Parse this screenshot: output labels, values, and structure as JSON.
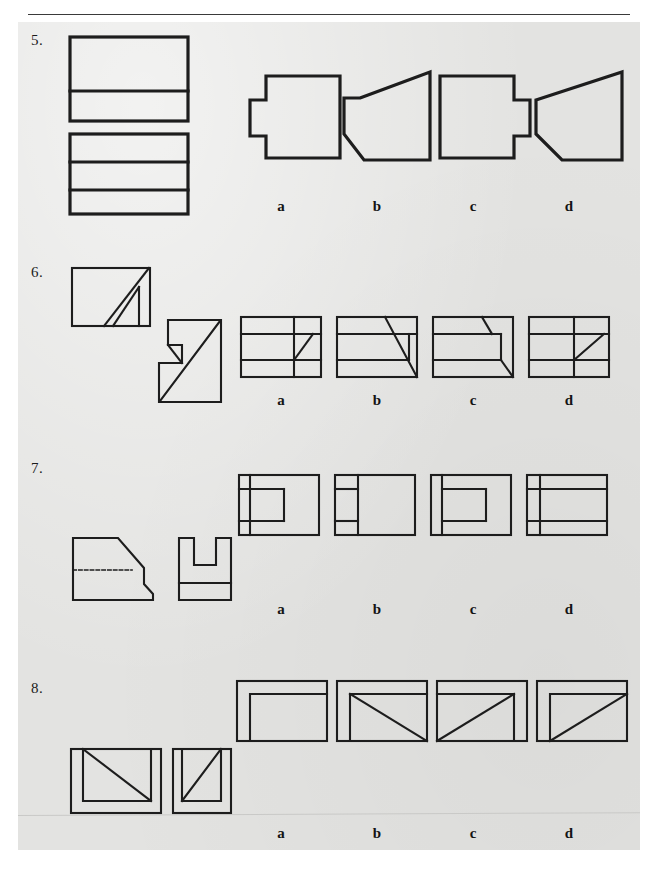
{
  "page": {
    "background_color": "#ffffff",
    "paper_color": "#e3e3e1",
    "ink_color": "#1d1d1d",
    "has_header_rule": true,
    "has_footer_rule": true
  },
  "option_labels": [
    "a",
    "b",
    "c",
    "d"
  ],
  "questions": [
    {
      "number": "5.",
      "given_views": [
        {
          "name": "top-view",
          "description": "rectangle with one horizontal line near the bottom"
        },
        {
          "name": "front-view",
          "description": "rectangle with two horizontal lines dividing it into three bands"
        }
      ],
      "options": [
        {
          "label": "a",
          "name": "option-a-shape",
          "description": "rectangle with a square notch projecting left from the middle of the left edge"
        },
        {
          "label": "b",
          "name": "option-b-shape",
          "description": "tapered polygon, wide at right, chamfered upper-left and lower-left corners"
        },
        {
          "label": "c",
          "name": "option-c-shape",
          "description": "rectangle with a square tab projecting right from the middle of the right edge"
        },
        {
          "label": "d",
          "name": "option-d-shape",
          "description": "tapered polygon, narrow at left, sloped top edge and chamfered bottom-right"
        }
      ]
    },
    {
      "number": "6.",
      "given_views": [
        {
          "name": "top-view",
          "description": "rectangle with a narrow diagonal rib running from lower-left to upper-right"
        },
        {
          "name": "front-view",
          "description": "z-shaped outline with a diagonal from lower-left to upper-right"
        }
      ],
      "options": [
        {
          "label": "a",
          "name": "option-a-shape",
          "description": "rectangle with two horizontal lines, a vertical line and a short diagonal at the right"
        },
        {
          "label": "b",
          "name": "option-b-shape",
          "description": "rectangle with two horizontal lines and a long diagonal to the lower-right corner"
        },
        {
          "label": "c",
          "name": "option-c-shape",
          "description": "rectangle with two horizontal lines, a short top diagonal and a corner diagonal at the right"
        },
        {
          "label": "d",
          "name": "option-d-shape",
          "description": "rectangle with two horizontal lines, a vertical line and a diagonal rising to the right"
        }
      ]
    },
    {
      "number": "7.",
      "given_views": [
        {
          "name": "front-view",
          "description": "right-trapezoid wedge with a sloping top, a dashed hidden line across the middle and a chamfered lower-right corner"
        },
        {
          "name": "side-view",
          "description": "rectangle with a U-shaped slot cut into the top and a horizontal line near the bottom"
        }
      ],
      "options": [
        {
          "label": "a",
          "name": "option-a-shape",
          "description": "rectangle with a narrow left band and an inset open-right rectangle in the middle"
        },
        {
          "label": "b",
          "name": "option-b-shape",
          "description": "rectangle with a narrow left band divided into three parts by horizontal lines"
        },
        {
          "label": "c",
          "name": "option-c-shape",
          "description": "rectangle with a narrow left band and an inset open-left rectangle in the middle"
        },
        {
          "label": "d",
          "name": "option-d-shape",
          "description": "rectangle with a narrow left band and two full-width horizontal lines"
        }
      ]
    },
    {
      "number": "8.",
      "given_views": [
        {
          "name": "top-view",
          "description": "rectangle with an inner rectangle and a diagonal from upper-left to lower-right"
        },
        {
          "name": "side-view",
          "description": "rectangle with an inner rectangle and a diagonal from lower-left to upper-right"
        }
      ],
      "options": [
        {
          "label": "a",
          "name": "option-a-shape",
          "description": "rectangle with an inner open rectangle and no diagonal"
        },
        {
          "label": "b",
          "name": "option-b-shape",
          "description": "rectangle with an inner open rectangle and a diagonal from upper-left to lower-right"
        },
        {
          "label": "c",
          "name": "option-c-shape",
          "description": "rectangle with an inner open rectangle and a diagonal from lower-left to upper-right"
        },
        {
          "label": "d",
          "name": "option-d-shape",
          "description": "rectangle with an inner open rectangle and a diagonal from lower-left to upper-right"
        }
      ]
    }
  ]
}
